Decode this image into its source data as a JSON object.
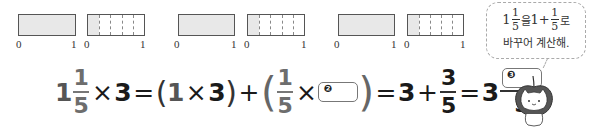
{
  "models": [
    {
      "full": {
        "left": 18,
        "width": 58
      },
      "part": {
        "left": 87,
        "width": 58,
        "divisions": 5,
        "shaded": 1
      },
      "ticks": [
        {
          "x": 16,
          "label": "0"
        },
        {
          "x": 71,
          "label": "1"
        },
        {
          "x": 84,
          "label": "0"
        },
        {
          "x": 140,
          "label": "1"
        }
      ]
    },
    {
      "full": {
        "left": 178,
        "width": 57
      },
      "part": {
        "left": 247,
        "width": 58,
        "divisions": 5,
        "shaded": 1
      },
      "ticks": [
        {
          "x": 174,
          "label": "0"
        },
        {
          "x": 231,
          "label": "1"
        },
        {
          "x": 244,
          "label": "0"
        },
        {
          "x": 301,
          "label": "1"
        }
      ]
    },
    {
      "full": {
        "left": 338,
        "width": 57
      },
      "part": {
        "left": 407,
        "width": 57,
        "divisions": 5,
        "shaded": 1
      },
      "ticks": [
        {
          "x": 334,
          "label": "0"
        },
        {
          "x": 391,
          "label": "1"
        },
        {
          "x": 404,
          "label": "0"
        },
        {
          "x": 460,
          "label": "1"
        }
      ]
    }
  ],
  "equation": {
    "mixed_whole": "1",
    "mixed_num": "1",
    "mixed_den": "5",
    "times": "×",
    "multiplier": "3",
    "equals": "=",
    "open_paren": "(",
    "close_paren": ")",
    "paren_a": "1",
    "paren_b": "3",
    "plus": "+",
    "frac_num": "1",
    "frac_den": "5",
    "blank2_marker": "❷",
    "result_whole": "3",
    "result_num": "3",
    "result_den": "5",
    "final_whole": "3",
    "blank3_marker": "❸",
    "final_den": "5"
  },
  "bubble": {
    "whole": "1",
    "num": "1",
    "den": "5",
    "particle1": "을",
    "whole2": "1",
    "plus": "+",
    "num2": "1",
    "den2": "5",
    "particle2": "로",
    "line2": "바꾸어 계산해."
  }
}
